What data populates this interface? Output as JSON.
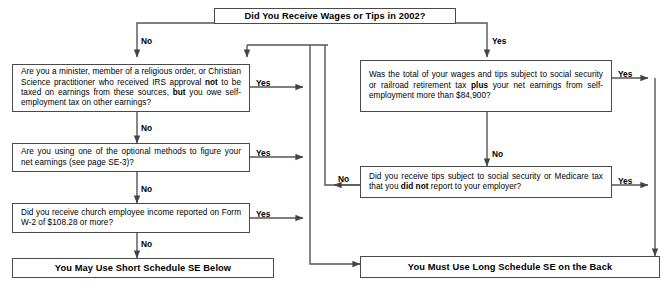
{
  "nodes": {
    "top": {
      "text": "Did You Receive Wages or Tips in 2002?"
    },
    "left1": {
      "pre": "Are you a minister, member of a religious order, or Christian Science practitioner who received IRS approval ",
      "b1": "not",
      "mid": " to be taxed on earnings from these sources, ",
      "b2": "but",
      "post": " you owe self-employment tax on other earnings?"
    },
    "left2": {
      "text": "Are you using one of the optional methods to figure your net earnings (see page SE-3)?"
    },
    "left3": {
      "text": "Did you receive church employee income reported on Form W-2 of $108.28 or more?"
    },
    "right1": {
      "pre": "Was the total of your wages and tips subject to social security or railroad retirement tax ",
      "b1": "plus",
      "post": " your net earnings from self-employment more than $84,900?"
    },
    "right2": {
      "pre": "Did you receive tips subject to social security or Medicare tax that you ",
      "b1": "did not",
      "post": " report to your employer?"
    },
    "result_short": {
      "text": "You May Use Short Schedule SE Below"
    },
    "result_long": {
      "text": "You Must Use Long Schedule SE on the Back"
    }
  },
  "labels": {
    "top_no": "No",
    "top_yes": "Yes",
    "left1_yes": "Yes",
    "left1_no": "No",
    "left2_yes": "Yes",
    "left2_no": "No",
    "left3_yes": "Yes",
    "left3_no": "No",
    "right1_yes": "Yes",
    "right1_no": "No",
    "right2_yes": "Yes",
    "right2_no": "No"
  },
  "colors": {
    "border": "#4a4a4a",
    "wire": "#555555",
    "background": "#ffffff",
    "text": "#000000"
  }
}
